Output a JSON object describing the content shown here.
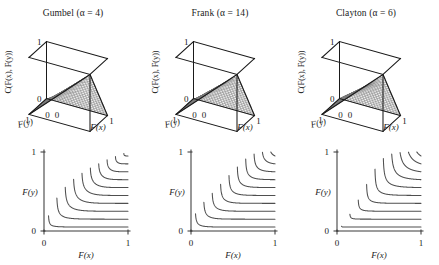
{
  "figure": {
    "columns": [
      {
        "id": "gumbel",
        "family": "Gumbel",
        "alpha_label": "(α = 4)",
        "title": "Gumbel (α = 4)",
        "surface": {
          "zlabel": "C(F(x), F(y))",
          "xlabel": "F(x)",
          "ylabel": "F(y)",
          "z_ticks": [
            "0",
            "1"
          ],
          "x_ticks": [
            "0",
            "1"
          ],
          "y_ticks": [
            "0",
            "1"
          ]
        },
        "contour": {
          "xlabel": "F(x)",
          "ylabel": "F(y)",
          "x_ticks": [
            "0",
            "1"
          ],
          "y_ticks": [
            "0",
            "1"
          ]
        }
      },
      {
        "id": "frank",
        "family": "Frank",
        "alpha_label": "(α = 14)",
        "title": "Frank (α = 14)",
        "surface": {
          "zlabel": "C(F(x), F(y))",
          "xlabel": "F(x)",
          "ylabel": "F(y)",
          "z_ticks": [
            "0",
            "1"
          ],
          "x_ticks": [
            "0",
            "1"
          ],
          "y_ticks": [
            "0",
            "1"
          ]
        },
        "contour": {
          "xlabel": "F(x)",
          "ylabel": "F(y)",
          "x_ticks": [
            "0",
            "1"
          ],
          "y_ticks": [
            "0",
            "1"
          ]
        }
      },
      {
        "id": "clayton",
        "family": "Clayton",
        "alpha_label": "(α = 6)",
        "title": "Clayton (α = 6)",
        "surface": {
          "zlabel": "C(F(x), F(y))",
          "xlabel": "F(x)",
          "ylabel": "F(y)",
          "z_ticks": [
            "0",
            "1"
          ],
          "x_ticks": [
            "0",
            "1"
          ],
          "y_ticks": [
            "0",
            "1"
          ]
        },
        "contour": {
          "xlabel": "F(x)",
          "ylabel": "F(y)",
          "x_ticks": [
            "0",
            "1"
          ],
          "y_ticks": [
            "0",
            "1"
          ]
        }
      }
    ]
  },
  "chart_data": [
    {
      "type": "surface",
      "panel": "top-left",
      "title": "Gumbel (α = 4)",
      "copula": "Gumbel",
      "alpha": 4,
      "formula": "C(u,v) = exp(-((-ln u)^a + (-ln v)^a)^(1/a))",
      "xlabel": "F(x)",
      "ylabel": "F(y)",
      "zlabel": "C(F(x), F(y))",
      "xlim": [
        0,
        1
      ],
      "ylim": [
        0,
        1
      ],
      "zlim": [
        0,
        1
      ],
      "x_tick_labels": [
        "0",
        "1"
      ],
      "y_tick_labels": [
        "0",
        "1"
      ],
      "z_tick_labels": [
        "0",
        "1"
      ],
      "grid": false,
      "mesh_n": 21,
      "description": "Monotone increasing copula surface rising from 0 at origin to 1 at (1,1); wireframe mesh, strong upper-tail dependence."
    },
    {
      "type": "surface",
      "panel": "top-middle",
      "title": "Frank (α = 14)",
      "copula": "Frank",
      "alpha": 14,
      "formula": "C(u,v) = -(1/a) ln(1 + (e^{-a u}-1)(e^{-a v}-1)/(e^{-a}-1))",
      "xlabel": "F(x)",
      "ylabel": "F(y)",
      "zlabel": "C(F(x), F(y))",
      "xlim": [
        0,
        1
      ],
      "ylim": [
        0,
        1
      ],
      "zlim": [
        0,
        1
      ],
      "x_tick_labels": [
        "0",
        "1"
      ],
      "y_tick_labels": [
        "0",
        "1"
      ],
      "z_tick_labels": [
        "0",
        "1"
      ],
      "grid": false,
      "mesh_n": 21,
      "description": "Symmetric copula surface with no tail dependence, rising from 0 to 1."
    },
    {
      "type": "surface",
      "panel": "top-right",
      "title": "Clayton (α = 6)",
      "copula": "Clayton",
      "alpha": 6,
      "formula": "C(u,v) = (u^{-a} + v^{-a} - 1)^{-1/a}",
      "xlabel": "F(x)",
      "ylabel": "F(y)",
      "zlabel": "C(F(x), F(y))",
      "xlim": [
        0,
        1
      ],
      "ylim": [
        0,
        1
      ],
      "zlim": [
        0,
        1
      ],
      "x_tick_labels": [
        "0",
        "1"
      ],
      "y_tick_labels": [
        "0",
        "1"
      ],
      "z_tick_labels": [
        "0",
        "1"
      ],
      "grid": false,
      "mesh_n": 21,
      "description": "Copula surface with strong lower-tail dependence, rising from 0 to 1."
    },
    {
      "type": "contour",
      "panel": "bottom-left",
      "copula": "Gumbel",
      "alpha": 4,
      "xlabel": "F(x)",
      "ylabel": "F(y)",
      "xlim": [
        0,
        1
      ],
      "ylim": [
        0,
        1
      ],
      "x_tick_labels": [
        "0",
        "1"
      ],
      "y_tick_labels": [
        "0",
        "1"
      ],
      "levels": [
        0.05,
        0.15,
        0.25,
        0.35,
        0.45,
        0.55,
        0.65,
        0.75,
        0.85,
        0.95
      ],
      "n_levels": 10,
      "grid": false,
      "description": "Nested L-shaped level curves of the Gumbel copula with rounded corners, asymptotic to the axes."
    },
    {
      "type": "contour",
      "panel": "bottom-middle",
      "copula": "Frank",
      "alpha": 14,
      "xlabel": "F(x)",
      "ylabel": "F(y)",
      "xlim": [
        0,
        1
      ],
      "ylim": [
        0,
        1
      ],
      "x_tick_labels": [
        "0",
        "1"
      ],
      "y_tick_labels": [
        "0",
        "1"
      ],
      "levels": [
        0.05,
        0.15,
        0.25,
        0.35,
        0.45,
        0.55,
        0.65,
        0.75,
        0.85,
        0.95
      ],
      "n_levels": 10,
      "grid": false,
      "description": "Nested L-shaped level curves of the Frank copula, corners tighter than Gumbel."
    },
    {
      "type": "contour",
      "panel": "bottom-right",
      "copula": "Clayton",
      "alpha": 6,
      "xlabel": "F(x)",
      "ylabel": "F(y)",
      "xlim": [
        0,
        1
      ],
      "ylim": [
        0,
        1
      ],
      "x_tick_labels": [
        "0",
        "1"
      ],
      "y_tick_labels": [
        "0",
        "1"
      ],
      "levels": [
        0.05,
        0.15,
        0.25,
        0.35,
        0.45,
        0.55,
        0.65,
        0.75,
        0.85,
        0.95
      ],
      "n_levels": 10,
      "grid": false,
      "description": "Nested level curves of the Clayton copula with sharper near-square corners."
    }
  ]
}
